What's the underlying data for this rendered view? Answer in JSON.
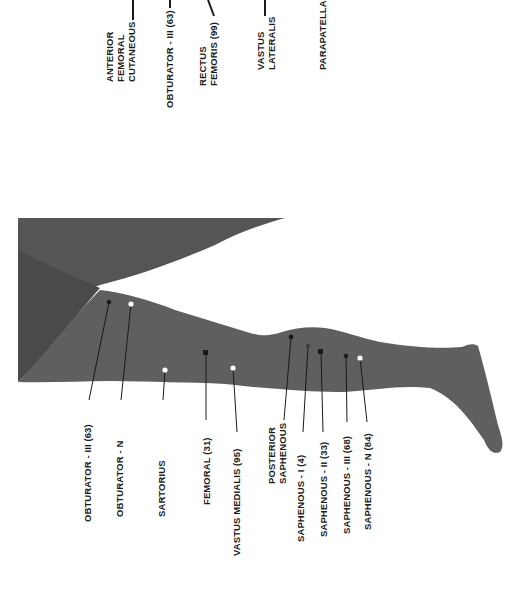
{
  "figure": {
    "colors": {
      "leg": "#5f5f5f",
      "leg_shadow": "#4d4d4d",
      "line": "#1a1a1a",
      "marker_white": "#ffffff",
      "marker_black": "#1a1a1a",
      "background": "#ffffff"
    },
    "top_labels": [
      {
        "id": "anterior-femoral-cutaneous",
        "text": "ANTERIOR\nFEMORAL\nCUTANEOUS"
      },
      {
        "id": "obturator-iii-top",
        "text": "OBTURATOR - III (63)"
      },
      {
        "id": "rectus-femoris",
        "text": "RECTUS\nFEMORIS (99)"
      },
      {
        "id": "vastus-lateralis",
        "text": "VASTUS\nLATERALIS"
      },
      {
        "id": "parapatella",
        "text": "PARAPATELLA"
      }
    ],
    "bottom_labels": [
      {
        "id": "obturator-iii",
        "text": "OBTURATOR - III (63)",
        "marker": "black-dot"
      },
      {
        "id": "obturator-n",
        "text": "OBTURATOR - N",
        "marker": "white-dot"
      },
      {
        "id": "sartorius",
        "text": "SARTORIUS",
        "marker": "white-dot"
      },
      {
        "id": "femoral",
        "text": "FEMORAL (31)",
        "marker": "black-square"
      },
      {
        "id": "vastus-medialis",
        "text": "VASTUS MEDIALIS (95)",
        "marker": "white-dot"
      },
      {
        "id": "posterior-saphenous",
        "text": "POSTERIOR\nSAPHENOUS",
        "marker": "black-dot"
      },
      {
        "id": "saphenous-i",
        "text": "SAPHENOUS - I (4)",
        "marker": "gray-dot"
      },
      {
        "id": "saphenous-ii",
        "text": "SAPHENOUS - II (33)",
        "marker": "black-square"
      },
      {
        "id": "saphenous-iii",
        "text": "SAPHENOUS - III (68)",
        "marker": "black-dot"
      },
      {
        "id": "saphenous-n",
        "text": "SAPHENOUS - N (84)",
        "marker": "white-dot"
      }
    ]
  }
}
